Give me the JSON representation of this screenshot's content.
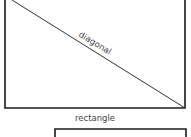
{
  "diagram": {
    "shapes": [
      {
        "type": "rectangle",
        "label": "rectangle"
      },
      {
        "type": "line",
        "label": "diagonal"
      },
      {
        "type": "rectangle",
        "label": ""
      }
    ],
    "labels": {
      "diagonal": "diagonal",
      "rectangle": "rectangle"
    },
    "colors": {
      "stroke": "#1a1a1a",
      "text": "#444444"
    }
  }
}
